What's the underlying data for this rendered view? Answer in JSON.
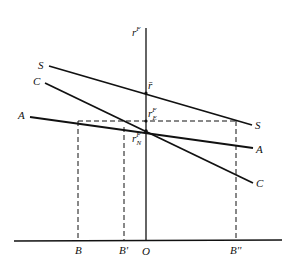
{
  "diagram": {
    "y_axis_label": "r",
    "y_axis_superscript": "F",
    "curves": [
      {
        "name": "S",
        "start_label": "S",
        "end_label": "S",
        "x1": 49,
        "y1": 66,
        "x2": 252,
        "y2": 125
      },
      {
        "name": "C",
        "start_label": "C",
        "end_label": "C",
        "x1": 45,
        "y1": 83,
        "x2": 253,
        "y2": 183
      },
      {
        "name": "A",
        "start_label": "A",
        "end_label": "A",
        "x1": 30,
        "y1": 117,
        "x2": 253,
        "y2": 148
      }
    ],
    "points": {
      "r_bar": {
        "label": "r̄",
        "x": 146,
        "y": 93
      },
      "r_E": {
        "label": "r",
        "sup": "F",
        "sub": "E",
        "x": 146,
        "y": 121
      },
      "r_N": {
        "label": "r",
        "sup": "F",
        "sub": "N",
        "x": 146,
        "y": 131
      }
    },
    "x_axis_labels": [
      {
        "label": "B",
        "x": 78
      },
      {
        "label": "B'",
        "x": 124
      },
      {
        "label": "O",
        "x": 146
      },
      {
        "label": "B''",
        "x": 236
      }
    ]
  }
}
